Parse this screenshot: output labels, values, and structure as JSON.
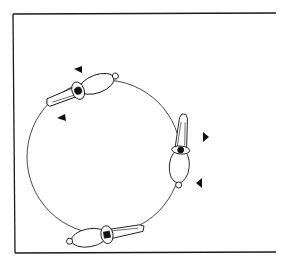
{
  "diagram": {
    "title": "",
    "colors": {
      "line": "#1a1a1a",
      "fill": "#ffffff",
      "marker": "#111111"
    },
    "elements": {
      "arena": "arena-border",
      "circle": "circle-path",
      "riders": [
        "horse-rider-top-left",
        "horse-rider-right",
        "horse-rider-bottom"
      ],
      "markers": [
        "direction-marker-1",
        "direction-marker-2",
        "direction-marker-3",
        "direction-marker-4"
      ]
    }
  }
}
